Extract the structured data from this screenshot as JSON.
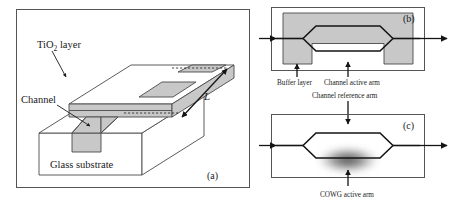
{
  "figure": {
    "background_color": "#ffffff",
    "gray_fill_color": "#c8c8c8",
    "line_color": "#1a1a1a"
  },
  "panel_a": {
    "id": "(a)",
    "labels": {
      "tio2_prefix": "TiO",
      "tio2_subscript": "2",
      "tio2_suffix": " layer",
      "channel": "Channel",
      "substrate": "Glass substrate",
      "length": "L"
    }
  },
  "panel_b": {
    "id": "(b)",
    "labels": {
      "buffer_layer": "Buffer layer",
      "channel_active_arm": "Channel active arm"
    }
  },
  "panel_c": {
    "id": "(c)",
    "labels": {
      "channel_reference_arm": "Channel reference arm",
      "cowg_active_arm": "COWG active arm"
    }
  }
}
